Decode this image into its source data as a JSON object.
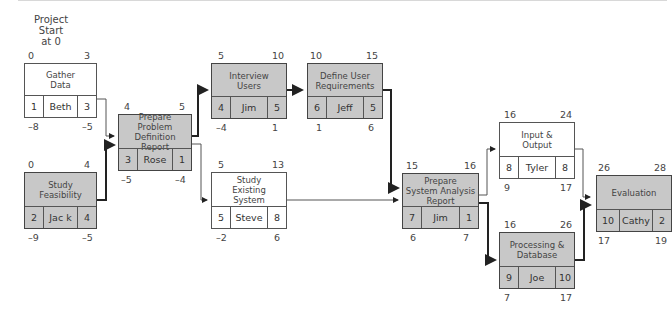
{
  "diagram": {
    "type": "network-diagram",
    "start_label": "Project\nStart\nat 0",
    "nodes": [
      {
        "key": "gather",
        "name": "Gather\nData",
        "id": "1",
        "resource": "Beth",
        "duration": "3",
        "es": "0",
        "ef": "3",
        "ls": "-8",
        "lf": "-5",
        "critical": false
      },
      {
        "key": "feasibility",
        "name": "Study\nFeasibility",
        "id": "2",
        "resource": "Jac k",
        "duration": "4",
        "es": "0",
        "ef": "4",
        "ls": "-9",
        "lf": "-5",
        "critical": true
      },
      {
        "key": "problem",
        "name": "Prepare\nProblem Definition\nReport",
        "id": "3",
        "resource": "Rose",
        "duration": "1",
        "es": "4",
        "ef": "5",
        "ls": "-5",
        "lf": "-4",
        "critical": true
      },
      {
        "key": "interview",
        "name": "Interview\nUsers",
        "id": "4",
        "resource": "Jim",
        "duration": "5",
        "es": "5",
        "ef": "10",
        "ls": "-4",
        "lf": "1",
        "critical": true
      },
      {
        "key": "existing",
        "name": "Study\nExisting\nSystem",
        "id": "5",
        "resource": "Steve",
        "duration": "8",
        "es": "5",
        "ef": "13",
        "ls": "-2",
        "lf": "6",
        "critical": false
      },
      {
        "key": "userreq",
        "name": "Define User\nRequirements",
        "id": "6",
        "resource": "Jeff",
        "duration": "5",
        "es": "10",
        "ef": "15",
        "ls": "1",
        "lf": "6",
        "critical": true
      },
      {
        "key": "analysis",
        "name": "Prepare\nSystem Analysis\nReport",
        "id": "7",
        "resource": "Jim",
        "duration": "1",
        "es": "15",
        "ef": "16",
        "ls": "6",
        "lf": "7",
        "critical": true
      },
      {
        "key": "io",
        "name": "Input &\nOutput",
        "id": "8",
        "resource": "Tyler",
        "duration": "8",
        "es": "16",
        "ef": "24",
        "ls": "9",
        "lf": "17",
        "critical": false
      },
      {
        "key": "processing",
        "name": "Processing &\nDatabase",
        "id": "9",
        "resource": "Joe",
        "duration": "10",
        "es": "16",
        "ef": "26",
        "ls": "7",
        "lf": "17",
        "critical": true
      },
      {
        "key": "evaluation",
        "name": "Evaluation",
        "id": "10",
        "resource": "Cathy",
        "duration": "2",
        "es": "26",
        "ef": "28",
        "ls": "17",
        "lf": "19",
        "critical": true
      }
    ],
    "edges": [
      {
        "from": "gather",
        "to": "problem",
        "critical": false
      },
      {
        "from": "feasibility",
        "to": "problem",
        "critical": true
      },
      {
        "from": "problem",
        "to": "interview",
        "critical": true
      },
      {
        "from": "problem",
        "to": "existing",
        "critical": false
      },
      {
        "from": "interview",
        "to": "userreq",
        "critical": true
      },
      {
        "from": "userreq",
        "to": "analysis",
        "critical": true
      },
      {
        "from": "existing",
        "to": "analysis",
        "critical": false
      },
      {
        "from": "analysis",
        "to": "io",
        "critical": false
      },
      {
        "from": "analysis",
        "to": "processing",
        "critical": true
      },
      {
        "from": "io",
        "to": "evaluation",
        "critical": false
      },
      {
        "from": "processing",
        "to": "evaluation",
        "critical": true
      }
    ]
  },
  "colors": {
    "critical_fill": "#c8c8c8",
    "normal_fill": "#ffffff",
    "line": "#222222"
  }
}
